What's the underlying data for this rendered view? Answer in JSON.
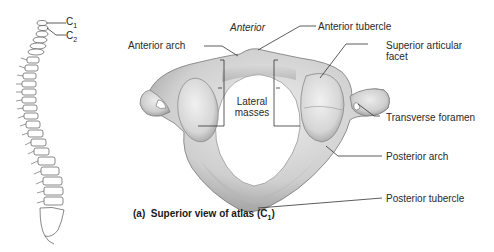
{
  "figure": {
    "caption_prefix": "(a)",
    "caption_text": "Superior view of atlas (C",
    "caption_sub": "1",
    "caption_suffix": ")"
  },
  "spine_inset": {
    "labels": [
      {
        "main": "C",
        "sub": "1"
      },
      {
        "main": "C",
        "sub": "2"
      }
    ]
  },
  "labels": {
    "anterior": "Anterior",
    "anterior_tubercle": "Anterior tubercle",
    "anterior_arch": "Anterior arch",
    "superior_articular_facet_1": "Superior articular",
    "superior_articular_facet_2": "facet",
    "lateral_masses_1": "Lateral",
    "lateral_masses_2": "masses",
    "transverse_foramen": "Transverse foramen",
    "posterior_arch": "Posterior arch",
    "posterior_tubercle": "Posterior tubercle"
  },
  "colors": {
    "bone_light": "#e6e6e6",
    "bone_mid": "#c4c4c4",
    "bone_dark": "#8a8a8a",
    "leader_line": "#333333"
  }
}
